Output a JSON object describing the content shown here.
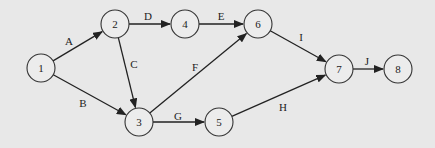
{
  "diagram": {
    "type": "activity-on-arrow network",
    "background": "#e8e8e8",
    "nodes": [
      {
        "id": "1",
        "label": "1",
        "x": 41,
        "y": 68
      },
      {
        "id": "2",
        "label": "2",
        "x": 115,
        "y": 24
      },
      {
        "id": "3",
        "label": "3",
        "x": 139,
        "y": 122
      },
      {
        "id": "4",
        "label": "4",
        "x": 185,
        "y": 24
      },
      {
        "id": "5",
        "label": "5",
        "x": 219,
        "y": 122
      },
      {
        "id": "6",
        "label": "6",
        "x": 258,
        "y": 24
      },
      {
        "id": "7",
        "label": "7",
        "x": 339,
        "y": 69
      },
      {
        "id": "8",
        "label": "8",
        "x": 398,
        "y": 69
      }
    ],
    "edges": [
      {
        "label": "A",
        "from": "1",
        "to": "2",
        "lx": 69,
        "ly": 41
      },
      {
        "label": "B",
        "from": "1",
        "to": "3",
        "lx": 83,
        "ly": 103
      },
      {
        "label": "C",
        "from": "2",
        "to": "3",
        "lx": 134,
        "ly": 64
      },
      {
        "label": "D",
        "from": "2",
        "to": "4",
        "lx": 148,
        "ly": 16
      },
      {
        "label": "E",
        "from": "4",
        "to": "6",
        "lx": 221,
        "ly": 16
      },
      {
        "label": "F",
        "from": "3",
        "to": "6",
        "lx": 195,
        "ly": 67
      },
      {
        "label": "G",
        "from": "3",
        "to": "5",
        "lx": 178,
        "ly": 116
      },
      {
        "label": "H",
        "from": "5",
        "to": "7",
        "lx": 283,
        "ly": 107
      },
      {
        "label": "I",
        "from": "6",
        "to": "7",
        "lx": 301,
        "ly": 37
      },
      {
        "label": "J",
        "from": "7",
        "to": "8",
        "lx": 367,
        "ly": 61
      }
    ]
  }
}
